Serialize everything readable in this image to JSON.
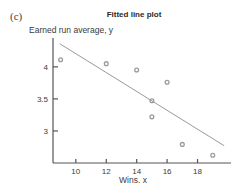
{
  "panel": {
    "label": "(c)"
  },
  "chart_data": {
    "type": "scatter",
    "title": "Fitted line plot",
    "xlabel": "Wins, x",
    "ylabel": "Earned run average, y",
    "x": [
      9,
      12,
      14,
      15,
      15,
      16,
      17,
      19
    ],
    "y": [
      4.11,
      4.05,
      3.95,
      3.47,
      3.22,
      3.76,
      2.79,
      2.62
    ],
    "points": [
      {
        "x": 9,
        "y": 4.11
      },
      {
        "x": 12,
        "y": 4.05
      },
      {
        "x": 14,
        "y": 3.95
      },
      {
        "x": 15,
        "y": 3.47
      },
      {
        "x": 15,
        "y": 3.22
      },
      {
        "x": 16,
        "y": 3.76
      },
      {
        "x": 17,
        "y": 2.79
      },
      {
        "x": 19,
        "y": 2.62
      }
    ],
    "fit_line": {
      "name": "fitted regression line",
      "x_start": 8.95,
      "y_start": 4.36,
      "x_end": 19.75,
      "y_end": 2.77
    },
    "xlim": [
      8.5,
      20.2
    ],
    "ylim": [
      2.5,
      4.45
    ],
    "xticks": [
      10,
      12,
      14,
      16,
      18
    ],
    "xtick_labels": [
      "10",
      "12",
      "14",
      "16",
      "18"
    ],
    "yticks": [
      3,
      3.5,
      4
    ],
    "ytick_labels": [
      "3",
      "3.5",
      "4"
    ],
    "grid": false,
    "legend": null,
    "marker_color": "#9a9a9a",
    "line_color": "#9a9a9a",
    "axis_color": "#555555"
  }
}
